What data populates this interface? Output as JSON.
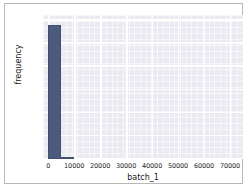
{
  "figure": {
    "background": "#ffffff",
    "frame_color": "#b8b8b8",
    "plot_background": "#eaeaf2",
    "grid_color": "#ffffff",
    "bar_color": "#4c5a7d"
  },
  "chart_data": {
    "type": "bar",
    "title": "",
    "subtitle": "",
    "xlabel": "batch_1",
    "ylabel": "frequency",
    "xlim": [
      -2000,
      75000
    ],
    "ylim": [
      0,
      6250
    ],
    "xticks": [
      0,
      10000,
      20000,
      30000,
      40000,
      50000,
      60000,
      70000
    ],
    "xticklabels": [
      "0",
      "10000",
      "20000",
      "30000",
      "40000",
      "50000",
      "60000",
      "70000"
    ],
    "yticks": [
      0,
      1000,
      2000,
      3000,
      4000,
      5000,
      6000
    ],
    "yticklabels": [
      "0",
      "1000",
      "2000",
      "3000",
      "4000",
      "5000",
      "6000"
    ],
    "grid": true,
    "minor_grid": true,
    "legend": null,
    "bin_edges": [
      0,
      5000,
      10000,
      15000,
      20000,
      25000,
      30000,
      35000,
      40000,
      45000,
      50000,
      55000,
      60000,
      65000,
      70000,
      75000
    ],
    "categories": [
      "0-5000",
      "5000-10000",
      "10000-15000",
      "15000-20000",
      "20000-25000",
      "25000-30000",
      "30000-35000",
      "35000-40000",
      "40000-45000",
      "45000-50000",
      "50000-55000",
      "55000-60000",
      "60000-65000",
      "65000-70000",
      "70000-75000"
    ],
    "values": [
      5800,
      70,
      0,
      0,
      0,
      0,
      0,
      0,
      0,
      0,
      0,
      0,
      0,
      0,
      0
    ],
    "annotations": []
  }
}
